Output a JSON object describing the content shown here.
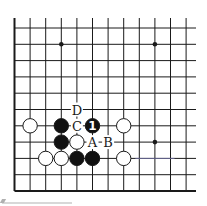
{
  "diagram": {
    "type": "go-board-fragment",
    "grid": {
      "origin_x": 14.5,
      "origin_y": 28,
      "col_spacing": 15.6,
      "row_spacing": 16.3,
      "cols": 12,
      "rows": 11,
      "top_y": 18,
      "right_x": 196,
      "edges": [
        "left",
        "bottom"
      ]
    },
    "star_points": [
      {
        "col": 3,
        "row": 1
      },
      {
        "col": 9,
        "row": 1
      },
      {
        "col": 9,
        "row": 7
      }
    ],
    "stones": [
      {
        "color": "white",
        "col": 1,
        "row": 6
      },
      {
        "color": "black",
        "col": 3,
        "row": 6
      },
      {
        "color": "black",
        "col": 5,
        "row": 6,
        "label": "1"
      },
      {
        "color": "white",
        "col": 7,
        "row": 6
      },
      {
        "color": "black",
        "col": 3,
        "row": 7
      },
      {
        "color": "white",
        "col": 4,
        "row": 7
      },
      {
        "color": "white",
        "col": 2,
        "row": 8
      },
      {
        "color": "white",
        "col": 3,
        "row": 8
      },
      {
        "color": "black",
        "col": 4,
        "row": 8
      },
      {
        "color": "black",
        "col": 5,
        "row": 8
      },
      {
        "color": "white",
        "col": 7,
        "row": 8
      }
    ],
    "labels": [
      {
        "text": "D",
        "col": 4,
        "row": 5
      },
      {
        "text": "C",
        "col": 4,
        "row": 6
      },
      {
        "text": "A",
        "col": 5,
        "row": 7
      },
      {
        "text": "B",
        "col": 6,
        "row": 7
      }
    ],
    "colors": {
      "line": "#1a1a1a",
      "black_stone": "#111111",
      "white_stone": "#ffffff",
      "background": "#ffffff",
      "tint_line": "#8a8ad0"
    }
  }
}
